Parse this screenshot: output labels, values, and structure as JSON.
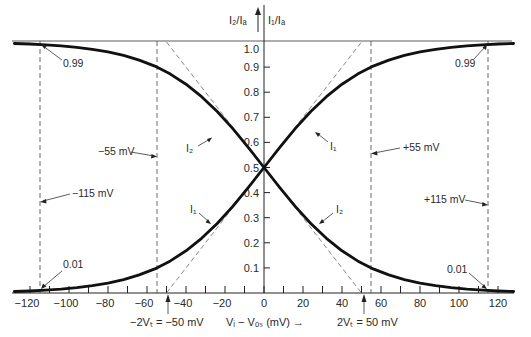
{
  "chart_data": {
    "type": "line",
    "title": "",
    "xlabel": "Vᵢ − Vₒₛ (mV) →",
    "ylabel_left": "I₂/Iₐ",
    "ylabel_right": "I₁/Iₐ",
    "xlim": [
      -130,
      130
    ],
    "ylim": [
      0,
      1.0
    ],
    "x_ticks": [
      -120,
      -100,
      -80,
      -60,
      -40,
      -20,
      0,
      20,
      40,
      60,
      80,
      100,
      120
    ],
    "x_tick_labels": [
      "−120",
      "−100",
      "−80",
      "−60",
      "−40",
      "−20",
      "0",
      "20",
      "40",
      "60",
      "80",
      "100",
      "120"
    ],
    "y_ticks": [
      0.1,
      0.2,
      0.3,
      0.4,
      0.5,
      0.6,
      0.7,
      0.8,
      0.9,
      1.0
    ],
    "y_tick_labels": [
      "0.1",
      "0.2",
      "0.3",
      "0.4",
      "0.5",
      "0.6",
      "0.7",
      "0.8",
      "0.9",
      "1.0"
    ],
    "grid": false,
    "series": [
      {
        "name": "I₁",
        "x": [
          -128,
          -120,
          -112,
          -104,
          -96,
          -88,
          -80,
          -72,
          -64,
          -56,
          -48,
          -40,
          -32,
          -24,
          -16,
          -8,
          0,
          8,
          16,
          24,
          32,
          40,
          48,
          56,
          64,
          72,
          80,
          88,
          96,
          104,
          112,
          120,
          128
        ],
        "values": [
          0.006,
          0.008,
          0.011,
          0.015,
          0.021,
          0.029,
          0.039,
          0.053,
          0.072,
          0.096,
          0.128,
          0.168,
          0.218,
          0.277,
          0.345,
          0.421,
          0.5,
          0.579,
          0.655,
          0.723,
          0.782,
          0.832,
          0.872,
          0.904,
          0.928,
          0.947,
          0.961,
          0.971,
          0.979,
          0.985,
          0.989,
          0.992,
          0.994
        ]
      },
      {
        "name": "I₂",
        "x": [
          -128,
          -120,
          -112,
          -104,
          -96,
          -88,
          -80,
          -72,
          -64,
          -56,
          -48,
          -40,
          -32,
          -24,
          -16,
          -8,
          0,
          8,
          16,
          24,
          32,
          40,
          48,
          56,
          64,
          72,
          80,
          88,
          96,
          104,
          112,
          120,
          128
        ],
        "values": [
          0.994,
          0.992,
          0.989,
          0.985,
          0.979,
          0.971,
          0.961,
          0.947,
          0.928,
          0.904,
          0.872,
          0.832,
          0.782,
          0.723,
          0.655,
          0.579,
          0.5,
          0.421,
          0.345,
          0.277,
          0.218,
          0.168,
          0.128,
          0.096,
          0.072,
          0.053,
          0.039,
          0.029,
          0.021,
          0.015,
          0.011,
          0.008,
          0.006
        ]
      }
    ],
    "reference_lines": [
      {
        "type": "vertical",
        "x": -115,
        "label": "−115 mV"
      },
      {
        "type": "vertical",
        "x": -55,
        "label": "−55 mV"
      },
      {
        "type": "vertical",
        "x": 55,
        "label": "+55 mV"
      },
      {
        "type": "vertical",
        "x": 115,
        "label": "+115 mV"
      },
      {
        "type": "tangent",
        "from": [
          -50,
          0
        ],
        "to": [
          50,
          1.0
        ]
      },
      {
        "type": "tangent",
        "from": [
          -50,
          1.0
        ],
        "to": [
          50,
          0
        ]
      }
    ],
    "annotations": [
      {
        "text": "0.99",
        "x": -115,
        "y": 0.99
      },
      {
        "text": "0.99",
        "x": 115,
        "y": 0.99
      },
      {
        "text": "0.01",
        "x": -115,
        "y": 0.01
      },
      {
        "text": "0.01",
        "x": 115,
        "y": 0.01
      },
      {
        "text": "−2Vₜ = −50 mV",
        "x": -50,
        "y": 0
      },
      {
        "text": "2Vₜ = 50 mV",
        "x": 50,
        "y": 0
      },
      {
        "text": "I₁",
        "series": "I₁"
      },
      {
        "text": "I₂",
        "series": "I₂"
      }
    ]
  },
  "labels": {
    "y_left": "I₂/Iₐ",
    "y_right": "I₁/Iₐ",
    "x_axis": "Vᵢ − Vₒₛ (mV) →",
    "neg_2vt": "−2Vₜ = −50 mV",
    "pos_2vt": "2Vₜ = 50 mV",
    "m115": "−115 mV",
    "m55": "−55 mV",
    "p55": "+55 mV",
    "p115": "+115 mV",
    "ann_099": "0.99",
    "ann_001": "0.01",
    "i1": "I₁",
    "i2": "I₂"
  }
}
